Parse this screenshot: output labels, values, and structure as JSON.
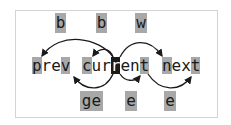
{
  "diagram": {
    "words": [
      {
        "text": "prev",
        "chars": [
          "p",
          "r",
          "e",
          "v"
        ],
        "highlight": [
          0,
          3
        ]
      },
      {
        "text": "current",
        "chars": [
          "c",
          "u",
          "r",
          "r",
          "e",
          "n",
          "t"
        ],
        "highlight": [
          0,
          6
        ],
        "cursor": 3
      },
      {
        "text": "next",
        "chars": [
          "n",
          "e",
          "x",
          "t"
        ],
        "highlight": [
          0,
          3
        ]
      }
    ],
    "top_motions": [
      {
        "key": "b",
        "from": "cursor",
        "to": "prev start"
      },
      {
        "key": "b",
        "from": "cursor",
        "to": "current start"
      },
      {
        "key": "w",
        "from": "cursor",
        "to": "next start"
      }
    ],
    "bottom_motions": [
      {
        "key": "ge",
        "from": "cursor",
        "to": "prev end"
      },
      {
        "key": "e",
        "from": "cursor",
        "to": "current end"
      },
      {
        "key": "e",
        "from": "current end",
        "to": "next end"
      }
    ],
    "colors": {
      "highlight": "#a8a8a8",
      "cursor": "#1a1a1a",
      "text": "#1a1a1a",
      "border": "#d4d4d4"
    }
  }
}
